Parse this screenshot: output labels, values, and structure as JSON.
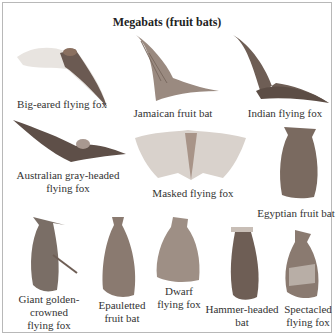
{
  "title": "Megabats (fruit bats)",
  "colors": {
    "border": "#b8b8b8",
    "bat_dark": "#6e5e55",
    "bat_light": "#d9d2cc",
    "text": "#333333"
  },
  "species": [
    {
      "label": "Big-eared flying fox",
      "pose": "flying"
    },
    {
      "label": "Jamaican fruit bat",
      "pose": "flying"
    },
    {
      "label": "Indian flying fox",
      "pose": "flying"
    },
    {
      "label_line1": "Australian gray-headed",
      "label_line2": "flying fox",
      "pose": "flying"
    },
    {
      "label": "Masked flying fox",
      "pose": "spread"
    },
    {
      "label": "Egyptian fruit bat",
      "pose": "hanging"
    },
    {
      "label_line1": "Giant golden-",
      "label_line2": "crowned",
      "label_line3": "flying fox",
      "pose": "hanging"
    },
    {
      "label_line1": "Epauletted",
      "label_line2": "fruit bat",
      "pose": "hanging"
    },
    {
      "label_line1": "Dwarf",
      "label_line2": "flying fox",
      "pose": "hanging"
    },
    {
      "label_line1": "Hammer-headed",
      "label_line2": "bat",
      "pose": "hanging"
    },
    {
      "label_line1": "Spectacled",
      "label_line2": "flying fox",
      "pose": "hanging"
    }
  ]
}
